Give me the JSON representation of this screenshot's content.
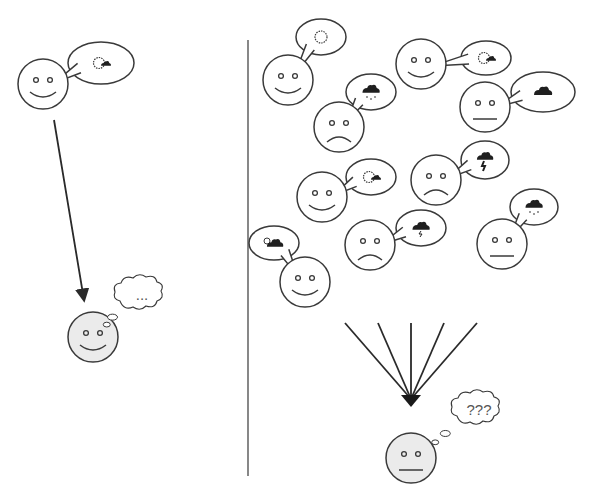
{
  "diagram": {
    "title": "",
    "colors": {
      "stroke": "#3a3a3a",
      "face_fill": "#ffffff",
      "receiver_fill": "#ebebeb",
      "icon_fill": "#1f1f1f"
    },
    "left_panel": {
      "sender": {
        "cx": 43,
        "cy": 84,
        "mood": "happy",
        "bubble": {
          "cx": 101,
          "cy": 63,
          "rx": 33,
          "ry": 21,
          "icon": "sun-cloud"
        }
      },
      "arrow": {
        "x1": 54,
        "y1": 120,
        "x2": 84,
        "y2": 300
      },
      "receiver": {
        "cx": 93,
        "cy": 337,
        "mood": "happy",
        "thought_text": "...",
        "thought": {
          "cx": 140,
          "cy": 295
        }
      }
    },
    "divider": {
      "x": 248,
      "y1": 40,
      "y2": 476
    },
    "right_panel": {
      "senders": [
        {
          "cx": 288,
          "cy": 80,
          "mood": "happy",
          "bubble": {
            "cx": 321,
            "cy": 37,
            "rx": 25,
            "ry": 18,
            "icon": "sun"
          }
        },
        {
          "cx": 421,
          "cy": 64,
          "mood": "happy",
          "bubble": {
            "cx": 486,
            "cy": 58,
            "rx": 25,
            "ry": 17,
            "icon": "sun-cloud"
          }
        },
        {
          "cx": 339,
          "cy": 127,
          "mood": "sad",
          "bubble": {
            "cx": 371,
            "cy": 92,
            "rx": 25,
            "ry": 18,
            "icon": "rain"
          }
        },
        {
          "cx": 485,
          "cy": 107,
          "mood": "neutral",
          "bubble": {
            "cx": 543,
            "cy": 92,
            "rx": 32,
            "ry": 20,
            "icon": "cloud"
          }
        },
        {
          "cx": 322,
          "cy": 197,
          "mood": "happy",
          "bubble": {
            "cx": 371,
            "cy": 177,
            "rx": 25,
            "ry": 18,
            "icon": "sun-cloud"
          }
        },
        {
          "cx": 436,
          "cy": 180,
          "mood": "sad",
          "bubble": {
            "cx": 485,
            "cy": 160,
            "rx": 24,
            "ry": 19,
            "icon": "storm"
          }
        },
        {
          "cx": 305,
          "cy": 282,
          "mood": "happy",
          "bubble": {
            "cx": 274,
            "cy": 243,
            "rx": 25,
            "ry": 17,
            "icon": "sun-cloud-small"
          }
        },
        {
          "cx": 370,
          "cy": 245,
          "mood": "sad",
          "bubble": {
            "cx": 421,
            "cy": 228,
            "rx": 25,
            "ry": 18,
            "icon": "cloud-lightning"
          }
        },
        {
          "cx": 502,
          "cy": 244,
          "mood": "neutral",
          "bubble": {
            "cx": 534,
            "cy": 207,
            "rx": 24,
            "ry": 18,
            "icon": "rain"
          }
        }
      ],
      "fan": {
        "tips": [
          [
            345,
            323
          ],
          [
            378,
            323
          ],
          [
            411,
            323
          ],
          [
            444,
            323
          ],
          [
            477,
            323
          ]
        ],
        "target": [
          411,
          405
        ]
      },
      "receiver": {
        "cx": 411,
        "cy": 458,
        "mood": "neutral",
        "thought_text": "???",
        "thought": {
          "cx": 477,
          "cy": 410
        }
      }
    }
  }
}
